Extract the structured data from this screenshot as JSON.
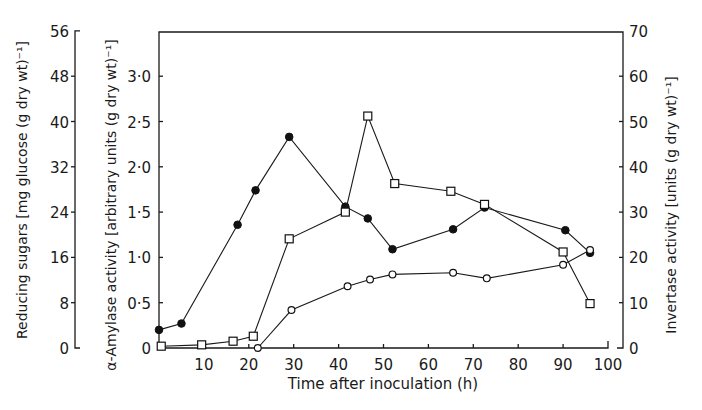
{
  "chart_data": {
    "type": "line",
    "title": "",
    "xlabel": "Time after inoculation (h)",
    "xlim": [
      0,
      100
    ],
    "xticks": [
      10,
      20,
      30,
      40,
      50,
      60,
      70,
      80,
      90,
      100
    ],
    "grid": false,
    "legend": "none (series distinguished by marker style)",
    "axes": {
      "left_outer": {
        "label": "Reducing sugars [mg glucose (g dry wt)⁻¹]",
        "ylim": [
          0,
          56
        ],
        "ticks": [
          0,
          8,
          16,
          24,
          32,
          40,
          48,
          56
        ],
        "tick_labels": [
          "0",
          "8",
          "16",
          "24",
          "32",
          "40",
          "48",
          "56"
        ]
      },
      "left_inner": {
        "label": "α-Amylase activity [arbitrary units (g dry wt)⁻¹]",
        "ylim": [
          0,
          3.35
        ],
        "ticks": [
          0,
          0.5,
          1.0,
          1.5,
          2.0,
          2.5,
          3.0
        ],
        "tick_labels": [
          "0",
          "0·5",
          "1·0",
          "1·5",
          "2·0",
          "2·5",
          "3·0"
        ]
      },
      "right": {
        "label": "Invertase activity [units (g dry wt)⁻¹]",
        "ylim": [
          0,
          70
        ],
        "ticks": [
          0,
          10,
          20,
          30,
          40,
          50,
          60,
          70
        ],
        "tick_labels": [
          "0",
          "10",
          "20",
          "30",
          "40",
          "50",
          "60",
          "70"
        ]
      }
    },
    "series": [
      {
        "name": "α-Amylase activity",
        "marker": "filled-circle",
        "axis": "left_inner",
        "x": [
          0,
          5,
          17.5,
          21.5,
          29,
          41.5,
          46.5,
          52,
          65.5,
          72.5,
          90.5,
          96
        ],
        "values": [
          0.2,
          0.27,
          1.36,
          1.74,
          2.33,
          1.56,
          1.43,
          1.09,
          1.31,
          1.55,
          1.3,
          1.05
        ]
      },
      {
        "name": "Reducing sugars",
        "marker": "open-circle",
        "axis": "left_outer",
        "x": [
          22,
          29.5,
          42,
          47,
          52,
          65.5,
          73,
          90,
          96
        ],
        "values": [
          0,
          6.7,
          10.9,
          12.1,
          13.0,
          13.3,
          12.3,
          14.7,
          17.3
        ]
      },
      {
        "name": "Invertase activity",
        "marker": "open-square",
        "axis": "right",
        "x": [
          0.5,
          9.5,
          16.5,
          21,
          29,
          41.5,
          46.5,
          52.5,
          65,
          72.5,
          90,
          96
        ],
        "values": [
          0.4,
          0.7,
          1.5,
          2.6,
          24.1,
          30.0,
          51.2,
          36.3,
          34.6,
          31.7,
          21.2,
          9.8
        ]
      }
    ]
  },
  "labels": {
    "xlabel": "Time after inoculation (h)",
    "left_outer_title": "Reducing sugars [mg glucose (g dry wt)⁻¹]",
    "left_inner_title": "α-Amylase activity [arbitrary units (g dry wt)⁻¹]",
    "right_title": "Invertase activity [units (g dry wt)⁻¹]"
  }
}
